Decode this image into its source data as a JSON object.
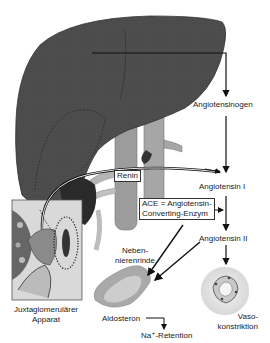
{
  "diagram": {
    "labels": {
      "angiotensinogen": "Angiotensinogen",
      "renin": "Renin",
      "angiotensin_1": "Angiotensin I",
      "ace_line1": "ACE = Angiotensin-",
      "ace_line2": "Converting-Enzym",
      "angiotensin_2": "Angiotensin II",
      "nebennierenrinde_line1": "Neben-",
      "nebennierenrinde_line2": "nierenrinde",
      "juxta_line1": "Juxtaglomerulärer",
      "juxta_line2": "Apparat",
      "aldosteron": "Aldosteron",
      "na_retention": "Na⁺-Retention",
      "vaso_line1": "Vaso-",
      "vaso_line2": "konstriktion"
    },
    "organs": [
      "liver",
      "vena-cava",
      "aorta",
      "juxtaglomerular-apparatus",
      "adrenal-cortex",
      "blood-vessel-cross-section"
    ],
    "colors": {
      "liver": "#4a4a4a",
      "vessel": "#9a9a9a",
      "adrenal_outer": "#a8a8a8",
      "adrenal_inner": "#cfcfcf",
      "arrow": "#111111"
    }
  }
}
